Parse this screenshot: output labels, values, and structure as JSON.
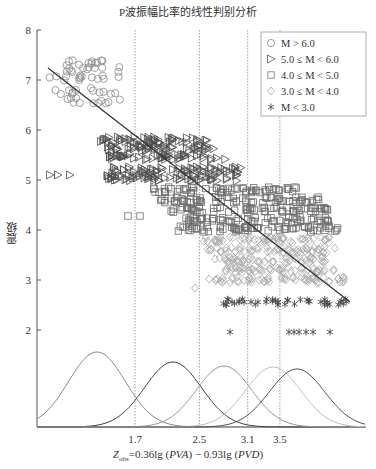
{
  "chart_data": {
    "type": "scatter",
    "title": "P波振幅比率的线性判别分析",
    "xlabel": "Z_obs=0.36lg (PVA) − 0.93lg (PVD)",
    "xlabel_parts": {
      "z": "Z",
      "sub": "obs",
      "rest": "=0.36lg (",
      "pva": "PVA",
      "mid": ") − 0.93lg (",
      "pvd": "PVD",
      "end": ")"
    },
    "ylabel": "震级",
    "ylim": [
      1.5,
      8
    ],
    "yticks": [
      2,
      3,
      4,
      5,
      6,
      7,
      8
    ],
    "xticks": [
      1.7,
      2.5,
      3.1,
      3.5
    ],
    "grid": false,
    "legend_position": "upper right",
    "legend": [
      {
        "label": "M > 6.0",
        "marker": "circle",
        "color": "#888888"
      },
      {
        "label": "5.0 ≤ M < 6.0",
        "marker": "triangle-right",
        "color": "#555555"
      },
      {
        "label": "4.0 ≤ M < 5.0",
        "marker": "square",
        "color": "#777777"
      },
      {
        "label": "3.0 ≤ M < 4.0",
        "marker": "diamond",
        "color": "#aaaaaa"
      },
      {
        "label": "M < 3.0",
        "marker": "asterisk",
        "color": "#555555"
      }
    ],
    "decision_boundaries": [
      1.7,
      2.5,
      3.1,
      3.5
    ],
    "regression_line": {
      "x": [
        0.5,
        4.6
      ],
      "y": [
        7.2,
        2.55
      ]
    },
    "series": [
      {
        "name": "M > 6.0",
        "x_range": [
          0.5,
          2.2
        ],
        "y_levels": [
          7.3,
          7.2,
          7.0,
          6.7,
          6.5
        ]
      },
      {
        "name": "5.0 ≤ M < 6.0",
        "x_range": [
          0.9,
          3.4
        ],
        "y_levels": [
          5.8,
          5.6,
          5.4,
          5.1,
          5.0
        ]
      },
      {
        "name": "4.0 ≤ M < 5.0",
        "x_range": [
          1.6,
          4.4
        ],
        "y_levels": [
          4.9,
          4.6,
          4.3,
          4.2,
          4.0
        ]
      },
      {
        "name": "3.0 ≤ M < 4.0",
        "x_range": [
          2.1,
          4.4
        ],
        "y_levels": [
          3.9,
          3.6,
          3.3,
          3.0
        ]
      },
      {
        "name": "M < 3.0",
        "x_range": [
          2.2,
          4.5
        ],
        "y_levels": [
          2.5,
          2.0
        ]
      }
    ],
    "density_curves": [
      {
        "name": "M > 6.0",
        "mean": 1.05,
        "color": "#888888"
      },
      {
        "name": "5.0 ≤ M < 6.0",
        "mean": 2.1,
        "color": "#444444"
      },
      {
        "name": "4.0 ≤ M < 5.0",
        "mean": 2.8,
        "color": "#999999"
      },
      {
        "name": "3.0 ≤ M < 4.0",
        "mean": 3.45,
        "color": "#bbbbbb"
      },
      {
        "name": "M < 3.0",
        "mean": 3.8,
        "color": "#555555"
      }
    ]
  }
}
